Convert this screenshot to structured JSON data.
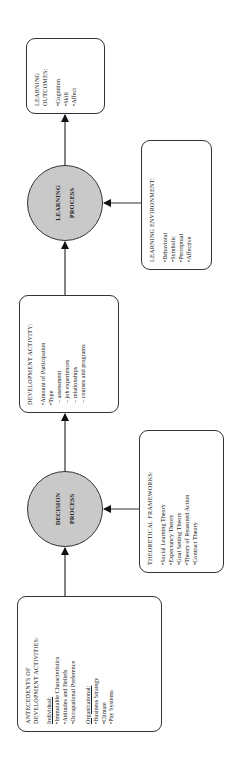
{
  "antecedents": {
    "title_line1": "ANTECEDENTS OF",
    "title_line2": "DEVELOPMENT ACTIVITIES:",
    "individual_label": "Individual:",
    "individual_items": [
      "Immutable Characteristics",
      "Attitudes and Beliefs",
      "Occupational Preference"
    ],
    "organizational_label": "Organizational:",
    "organizational_items": [
      "Business Strategy",
      "Climate",
      "Pay Systems"
    ]
  },
  "decision_process": {
    "line1": "DECISION",
    "line2": "PROCESS"
  },
  "theoretical_frameworks": {
    "title": "THEORETICAL FRAMEWORKS:",
    "items": [
      "Social Learning Theory",
      "Expectancy Theory",
      "Goal Setting Theory",
      "Theory of Reasoned Action",
      "Contract Theory"
    ]
  },
  "development_activity": {
    "title": "DEVELOPMENT ACTIVITY:",
    "items": [
      "Amount of Participation",
      "Type"
    ],
    "sub_items": [
      "assessment",
      "job experiences",
      "relationships",
      "courses and programs"
    ]
  },
  "learning_process": {
    "line1": "LEARNING",
    "line2": "PROCESS"
  },
  "learning_environment": {
    "title": "LEARNING ENVIRONMENT:",
    "items": [
      "Behavioral",
      "Symbolic",
      "Perceptual",
      "Affective"
    ]
  },
  "learning_outcomes": {
    "title_line1": "LEARNING",
    "title_line2": "OUTCOMES:",
    "items": [
      "Cognition",
      "Skill",
      "Affect"
    ]
  },
  "colors": {
    "circle_fill": "#c9c9c9",
    "stroke": "#333333",
    "background": "#ffffff"
  }
}
